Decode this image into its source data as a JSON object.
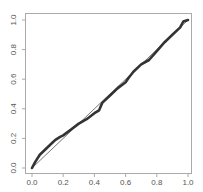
{
  "chart_data": {
    "type": "line",
    "title": "",
    "xlabel": "",
    "ylabel": "",
    "xlim": [
      0,
      1
    ],
    "ylim": [
      0,
      1
    ],
    "grid": false,
    "legend": null,
    "x_ticks": [
      "0.0",
      "0.2",
      "0.4",
      "0.6",
      "0.8",
      "1.0"
    ],
    "y_ticks": [
      "0.0",
      "0.2",
      "0.4",
      "0.6",
      "0.8",
      "1.0"
    ],
    "series": [
      {
        "name": "empirical",
        "style": "thick dark points/line",
        "color": "#333333",
        "x": [
          0.0,
          0.02,
          0.05,
          0.08,
          0.1,
          0.13,
          0.15,
          0.18,
          0.2,
          0.25,
          0.3,
          0.35,
          0.4,
          0.43,
          0.45,
          0.5,
          0.55,
          0.6,
          0.62,
          0.65,
          0.7,
          0.75,
          0.8,
          0.85,
          0.9,
          0.95,
          0.97,
          1.0
        ],
        "y": [
          0.0,
          0.04,
          0.09,
          0.12,
          0.14,
          0.17,
          0.19,
          0.21,
          0.22,
          0.26,
          0.3,
          0.33,
          0.37,
          0.39,
          0.44,
          0.49,
          0.54,
          0.58,
          0.61,
          0.65,
          0.7,
          0.73,
          0.79,
          0.85,
          0.9,
          0.95,
          0.99,
          1.0
        ]
      },
      {
        "name": "reference",
        "style": "thin line y=x",
        "color": "#555555",
        "x": [
          0,
          1
        ],
        "y": [
          0,
          1
        ]
      }
    ]
  }
}
